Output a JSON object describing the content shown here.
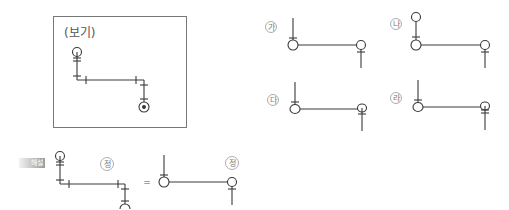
{
  "example_box": {
    "title": "(보기)"
  },
  "options": [
    {
      "id": "ga",
      "label": "가"
    },
    {
      "id": "na",
      "label": "나"
    },
    {
      "id": "da",
      "label": "다"
    },
    {
      "id": "ra",
      "label": "라"
    }
  ],
  "explanation": {
    "badge": "해설",
    "left_label": "정",
    "equals": "=",
    "right_label": "정"
  },
  "colors": {
    "stroke": "#3a3a3a",
    "box_border": "#777777",
    "label_ring": "#999999"
  }
}
